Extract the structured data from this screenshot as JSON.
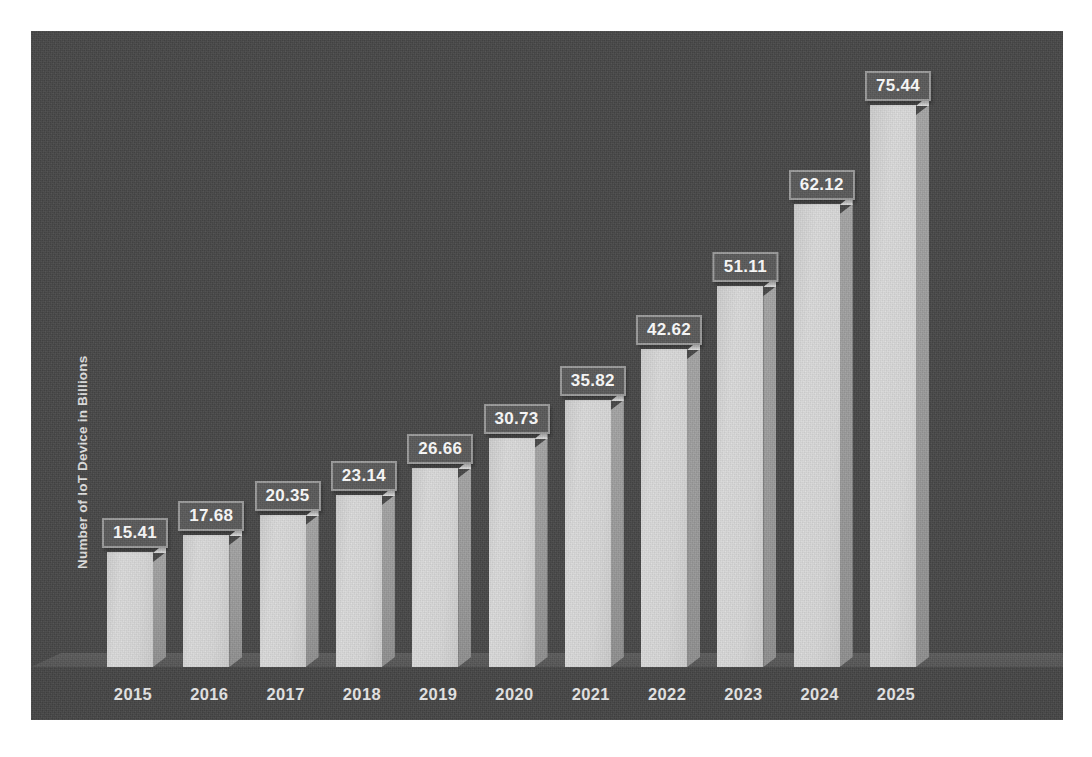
{
  "chart_data": {
    "type": "bar",
    "title": "",
    "subtitle": "",
    "xlabel": "",
    "ylabel": "Number of IoT Device in Billions",
    "categories": [
      "2015",
      "2016",
      "2017",
      "2018",
      "2019",
      "2020",
      "2021",
      "2022",
      "2023",
      "2024",
      "2025"
    ],
    "values": [
      15.41,
      17.68,
      20.35,
      23.14,
      26.66,
      30.73,
      35.82,
      42.62,
      51.11,
      62.12,
      75.44
    ],
    "value_labels": [
      "15.41",
      "17.68",
      "20.35",
      "23.14",
      "26.66",
      "30.73",
      "35.82",
      "42.62",
      "51.11",
      "62.12",
      "75.44"
    ],
    "ylim": [
      0,
      75.44
    ],
    "grid": false,
    "legend": null,
    "legend_position": "none",
    "style": "3d-column",
    "axis_ticks_visible": false
  },
  "colors": {
    "background": "#474747",
    "bar_front": "#d9d9d9",
    "bar_side": "#9a9a9a",
    "bar_top": "#e6e6e6",
    "floor": "#565656",
    "label_box_fill": "#5a5a5a",
    "label_box_border": "#9b9b9b",
    "label_text": "#ffffff",
    "tick_text": "#e9e9e9",
    "axis_title_text": "#e2e2e2",
    "page": "#ffffff"
  }
}
